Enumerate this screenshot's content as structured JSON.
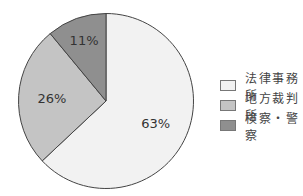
{
  "chart_data": {
    "type": "pie",
    "title": "",
    "categories": [
      "法律事務所",
      "地方裁判所",
      "検察・警察"
    ],
    "values": [
      63,
      26,
      11
    ],
    "labels": [
      "63%",
      "26%",
      "11%"
    ],
    "colors": [
      "#f2f2f2",
      "#c4c4c4",
      "#8f8f8f"
    ],
    "start_angle_deg": 0,
    "direction": "clockwise",
    "legend_position": "right"
  },
  "legend": {
    "items": [
      {
        "label": "法律事務所",
        "color": "#f2f2f2"
      },
      {
        "label": "地方裁判所",
        "color": "#c4c4c4"
      },
      {
        "label": "検察・警察",
        "color": "#8f8f8f"
      }
    ]
  }
}
